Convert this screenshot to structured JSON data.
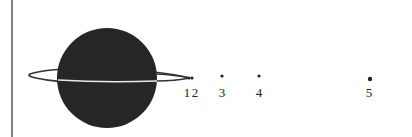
{
  "diagram": {
    "planet": {
      "cx": 107,
      "cy": 78,
      "r": 50,
      "fill": "#262626"
    },
    "ring": {
      "cx": 107,
      "cy": 76,
      "rx": 83,
      "ry": 6,
      "stroke": "#333333"
    },
    "moons": [
      {
        "label": "1",
        "cx": 189,
        "cy": 78,
        "lx": 187,
        "ly": 97
      },
      {
        "label": "2",
        "cx": 192,
        "cy": 78,
        "lx": 195,
        "ly": 97
      },
      {
        "label": "3",
        "cx": 222,
        "cy": 76,
        "lx": 222,
        "ly": 97
      },
      {
        "label": "4",
        "cx": 259,
        "cy": 76,
        "lx": 259,
        "ly": 97
      },
      {
        "label": "5",
        "cx": 370,
        "cy": 79,
        "lx": 369,
        "ly": 97
      }
    ]
  }
}
